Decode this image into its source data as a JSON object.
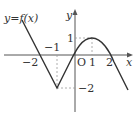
{
  "diagram": {
    "function_label": "y=f(x)",
    "axes": {
      "x_label": "x",
      "y_label": "y",
      "origin_label": "O"
    },
    "x_ticks": [
      {
        "value": -2,
        "label": "−2"
      },
      {
        "value": -1,
        "label": "−1"
      },
      {
        "value": 1,
        "label": "1"
      },
      {
        "value": 2,
        "label": "2"
      }
    ],
    "y_ticks": [
      {
        "value": 1,
        "label": "1"
      },
      {
        "value": -2,
        "label": "−2"
      }
    ],
    "key_points": [
      {
        "x": -2,
        "y": 0
      },
      {
        "x": -1,
        "y": -2
      },
      {
        "x": 1,
        "y": 1
      },
      {
        "x": 2,
        "y": 0
      }
    ],
    "colors": {
      "curve": "#333333",
      "axis": "#555555",
      "guide": "#999999"
    }
  }
}
